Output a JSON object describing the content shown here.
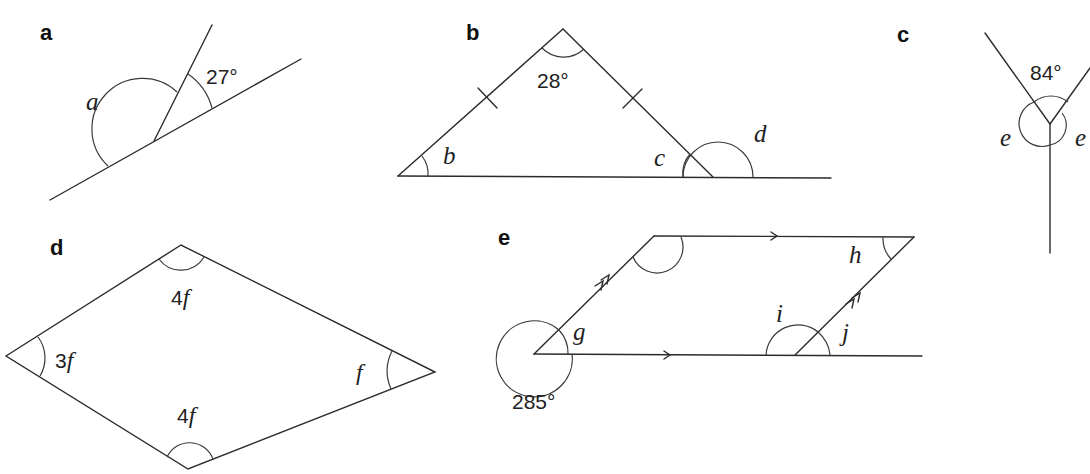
{
  "parts": {
    "a": {
      "label": "a",
      "angles": {
        "given": "27°",
        "unknown": "a"
      }
    },
    "b": {
      "label": "b",
      "angles": {
        "apex": "28°",
        "left": "b",
        "right_interior": "c",
        "exterior": "d"
      },
      "notes": "isosceles triangle, two equal sides marked with tick marks"
    },
    "c": {
      "label": "c",
      "angles": {
        "top": "84°",
        "left": "e",
        "right": "e"
      }
    },
    "d": {
      "label": "d",
      "angles": {
        "top": {
          "coef": "4",
          "var": "f"
        },
        "left": {
          "coef": "3",
          "var": "f"
        },
        "right": {
          "coef": "",
          "var": "f"
        },
        "bottom": {
          "coef": "4",
          "var": "f"
        }
      },
      "notes": "kite-shaped quadrilateral"
    },
    "e": {
      "label": "e",
      "angles": {
        "reflex": "285°",
        "g": "g",
        "h": "h",
        "i": "i",
        "j": "j"
      },
      "notes": "parallelogram with parallel-arrow markings; base line extended"
    }
  },
  "colors": {
    "line": "#2b2b2b",
    "text": "#222222",
    "background": "#ffffff"
  }
}
